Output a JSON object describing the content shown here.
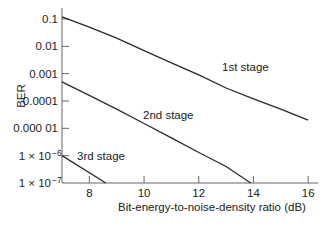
{
  "chart_data": {
    "type": "line",
    "title": "",
    "xlabel": "Bit-energy-to-noise-density ratio (dB)",
    "ylabel": "BER",
    "xlim": [
      7,
      16.1
    ],
    "ylim": [
      1e-07,
      0.15
    ],
    "yscale": "log",
    "grid": false,
    "legend": "inline labels",
    "x_ticks": [
      8,
      10,
      12,
      14,
      16
    ],
    "x_tick_labels": [
      "8",
      "10",
      "12",
      "14",
      "16"
    ],
    "y_ticks": [
      0.1,
      0.01,
      0.001,
      0.0001,
      1e-05,
      1e-06,
      1e-07
    ],
    "y_tick_labels": [
      "0.1",
      "0.01",
      "0.001",
      "0.0001",
      "0.000 01",
      "1 × 10",
      "1 × 10"
    ],
    "y_tick_exponents": [
      "",
      "",
      "",
      "",
      "",
      "−6",
      "−7"
    ],
    "series": [
      {
        "name": "1st stage",
        "x": [
          7,
          8,
          9,
          10,
          11,
          12,
          13,
          14,
          15,
          16
        ],
        "y": [
          0.12,
          0.05,
          0.02,
          0.007,
          0.0025,
          0.0009,
          0.0003,
          0.00012,
          5e-05,
          2e-05
        ]
      },
      {
        "name": "2nd stage",
        "x": [
          7,
          8,
          9,
          10,
          11,
          12,
          13,
          13.9
        ],
        "y": [
          0.0005,
          0.00016,
          5e-05,
          1.5e-05,
          4.5e-06,
          1.3e-06,
          4e-07,
          1e-07
        ]
      },
      {
        "name": "3rd stage",
        "x": [
          7,
          8.6
        ],
        "y": [
          1e-06,
          1e-07
        ]
      }
    ]
  }
}
